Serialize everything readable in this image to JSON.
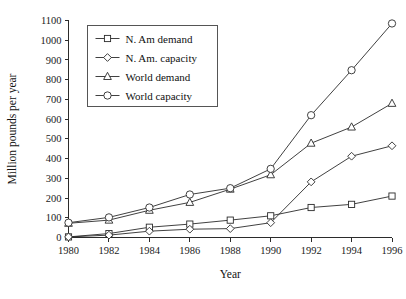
{
  "chart_data": {
    "type": "line",
    "title": "",
    "xlabel": "Year",
    "ylabel": "Million pounds per year",
    "x": [
      1980,
      1982,
      1984,
      1986,
      1988,
      1990,
      1992,
      1994,
      1996
    ],
    "xtick_labels": [
      "1980",
      "1982",
      "1984",
      "1986",
      "1988",
      "1990",
      "1992",
      "1994",
      "1996"
    ],
    "ytick_labels": [
      "0",
      "100",
      "200",
      "300",
      "400",
      "500",
      "600",
      "700",
      "800",
      "900",
      "1000",
      "1100"
    ],
    "yticks": [
      0,
      100,
      200,
      300,
      400,
      500,
      600,
      700,
      800,
      900,
      1000,
      1100
    ],
    "xlim": [
      1980,
      1996
    ],
    "ylim": [
      0,
      1100
    ],
    "grid": false,
    "legend_position": "upper-left",
    "series": [
      {
        "name": "N. Am demand",
        "marker": "square",
        "values": [
          3,
          20,
          52,
          68,
          88,
          110,
          152,
          168,
          210
        ]
      },
      {
        "name": "N. Am. capacity",
        "marker": "diamond",
        "values": [
          3,
          12,
          32,
          42,
          45,
          75,
          282,
          412,
          465
        ]
      },
      {
        "name": "World demand",
        "marker": "triangle",
        "values": [
          72,
          88,
          138,
          178,
          245,
          318,
          478,
          560,
          680
        ]
      },
      {
        "name": "World capacity",
        "marker": "circle",
        "values": [
          75,
          102,
          152,
          218,
          250,
          348,
          620,
          848,
          1085
        ]
      }
    ]
  },
  "legend": {
    "entries": [
      {
        "label": "N. Am demand",
        "marker": "square"
      },
      {
        "label": "N. Am. capacity",
        "marker": "diamond"
      },
      {
        "label": "World demand",
        "marker": "triangle"
      },
      {
        "label": "World capacity",
        "marker": "circle"
      }
    ]
  },
  "colors": {
    "line": "#2b2b2b",
    "marker_fill": "#ffffff",
    "axis": "#2b2b2b",
    "text": "#111111",
    "background": "#ffffff",
    "legend_border": "#555555"
  }
}
